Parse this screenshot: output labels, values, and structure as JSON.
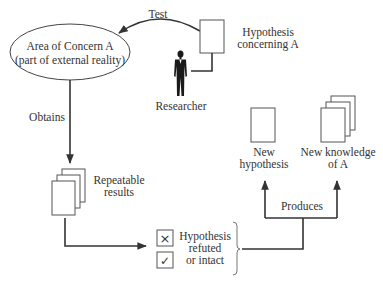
{
  "diagram": {
    "nodes": {
      "area_of_concern": {
        "line1": "Area of Concern A",
        "line2": "(part of external reality)"
      },
      "hypothesis": {
        "line1": "Hypothesis",
        "line2": "concerning A"
      },
      "researcher": {
        "label": "Researcher"
      },
      "repeatable_results": {
        "line1": "Repeatable",
        "line2": "results"
      },
      "outcome": {
        "line1": "Hypothesis",
        "line2": "refuted",
        "line3": "or intact",
        "refuted_symbol": "×",
        "intact_symbol": "✓"
      },
      "new_hypothesis": {
        "line1": "New",
        "line2": "hypothesis"
      },
      "new_knowledge": {
        "line1": "New knowledge",
        "line2": "of A"
      }
    },
    "edges": {
      "test": "Test",
      "obtains": "Obtains",
      "produces": "Produces"
    },
    "colors": {
      "stroke": "#333333",
      "text": "#333333",
      "background": "#ffffff"
    }
  }
}
